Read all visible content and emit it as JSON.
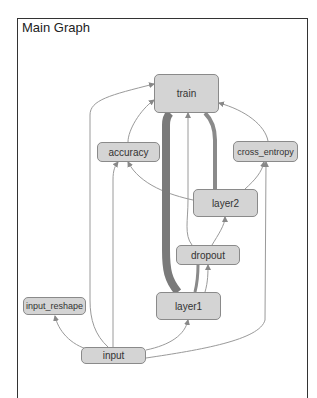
{
  "graph": {
    "title": "Main Graph",
    "nodes": {
      "train": "train",
      "accuracy": "accuracy",
      "cross_entropy": "cross_entropy",
      "layer2": "layer2",
      "dropout": "dropout",
      "layer1": "layer1",
      "input_reshape": "input_reshape",
      "input": "input"
    },
    "colors": {
      "node_fill": "#d4d4d4",
      "node_border": "#8a8a8a",
      "edge": "#999999",
      "thick_edge": "#777777"
    }
  }
}
